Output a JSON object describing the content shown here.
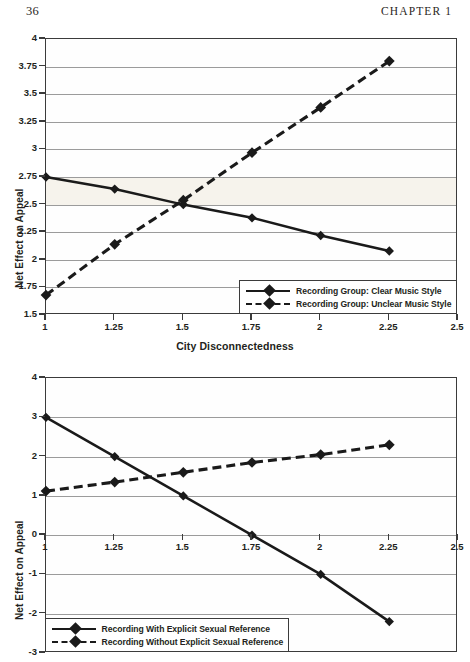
{
  "running_head": {
    "page_number": "36",
    "chapter": "CHAPTER 1"
  },
  "chart_data": [
    {
      "id": "top",
      "type": "line",
      "title": "",
      "xlabel": "City Disconnectedness",
      "ylabel": "Net Effect on Appeal",
      "x": [
        1,
        1.25,
        1.5,
        1.75,
        2,
        2.25
      ],
      "xlim": [
        1,
        2.5
      ],
      "ylim": [
        1.5,
        4
      ],
      "xticks": [
        "1",
        "1.25",
        "1.5",
        "1.75",
        "2",
        "2.25",
        "2.5"
      ],
      "xtick_values": [
        1,
        1.25,
        1.5,
        1.75,
        2,
        2.25,
        2.5
      ],
      "yticks": [
        "1.5",
        "1.75",
        "2",
        "2.25",
        "2.5",
        "2.75",
        "3",
        "3.25",
        "3.5",
        "3.75",
        "4"
      ],
      "ytick_values": [
        1.5,
        1.75,
        2,
        2.25,
        2.5,
        2.75,
        3,
        3.25,
        3.5,
        3.75,
        4
      ],
      "grid": true,
      "legend_position": "bottom-right",
      "series": [
        {
          "name": "Recording Group: Clear Music Style",
          "style": "solid",
          "marker": "diamond",
          "values": [
            2.75,
            2.64,
            2.5,
            2.38,
            2.22,
            2.08
          ]
        },
        {
          "name": "Recording Group: Unclear Music Style",
          "style": "dashed",
          "marker": "diamond",
          "values": [
            1.68,
            2.14,
            2.54,
            2.97,
            3.38,
            3.8
          ]
        }
      ]
    },
    {
      "id": "bottom",
      "type": "line",
      "title": "",
      "xlabel": "",
      "ylabel": "Net Effect on Appeal",
      "x": [
        1,
        1.25,
        1.5,
        1.75,
        2,
        2.25
      ],
      "xlim": [
        1,
        2.5
      ],
      "ylim": [
        -3,
        4
      ],
      "xticks": [
        "1",
        "1.25",
        "1.5",
        "1.75",
        "2",
        "2.25",
        "2.5"
      ],
      "xtick_values": [
        1,
        1.25,
        1.5,
        1.75,
        2,
        2.25,
        2.5
      ],
      "yticks": [
        "-3",
        "-2",
        "-1",
        "0",
        "1",
        "2",
        "3",
        "4"
      ],
      "ytick_values": [
        -3,
        -2,
        -1,
        0,
        1,
        2,
        3,
        4
      ],
      "grid": true,
      "xaxis_at_y": 0,
      "legend_position": "bottom-left",
      "series": [
        {
          "name": "Recording With Explicit Sexual Reference",
          "style": "solid",
          "marker": "diamond",
          "values": [
            3.0,
            2.0,
            1.0,
            0.0,
            -1.0,
            -2.2
          ]
        },
        {
          "name": "Recording Without Explicit Sexual Reference",
          "style": "dashed",
          "marker": "diamond",
          "values": [
            1.12,
            1.35,
            1.6,
            1.85,
            2.05,
            2.3
          ]
        }
      ]
    }
  ],
  "colors": {
    "line": "#1a1a1a",
    "grid": "#9b9b9b",
    "frame": "#3b3b3b",
    "band": "#f6f3ec",
    "text": "#231f20"
  }
}
